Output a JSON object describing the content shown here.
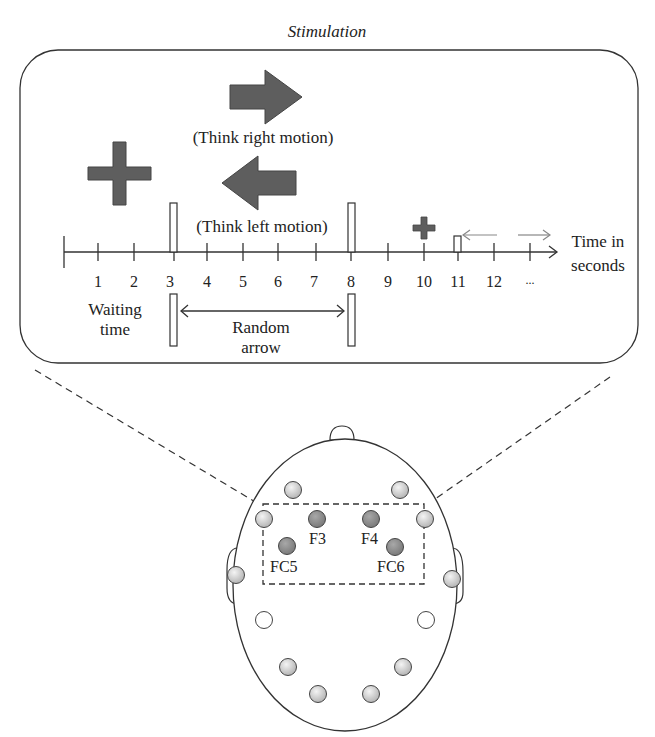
{
  "title": "Stimulation",
  "stimuli": {
    "right_label": "(Think right motion)",
    "left_label": "(Think left motion)"
  },
  "timeline": {
    "ticks": [
      "1",
      "2",
      "3",
      "4",
      "5",
      "6",
      "7",
      "8",
      "9",
      "10",
      "11",
      "12",
      "..."
    ],
    "axis_label_line1": "Time in",
    "axis_label_line2": "seconds",
    "waiting_line1": "Waiting",
    "waiting_line2": "time",
    "random_line1": "Random",
    "random_line2": "arrow"
  },
  "electrodes": {
    "F3": "F3",
    "F4": "F4",
    "FC5": "FC5",
    "FC6": "FC6"
  },
  "colors": {
    "shape_fill": "#5e5e5e",
    "line": "#333333",
    "active_electrode": "#8c8c8c",
    "inactive_electrode": "#d8d8d8"
  }
}
